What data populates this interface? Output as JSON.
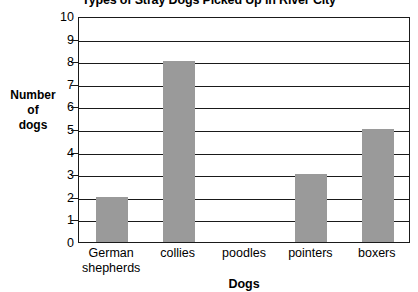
{
  "chart_data": {
    "type": "bar",
    "title": "Types of Stray Dogs Picked Up in River City",
    "xlabel": "Dogs",
    "ylabel": "Number of dogs",
    "ylabel_lines": [
      "Number",
      "of",
      "dogs"
    ],
    "categories": [
      "German shepherds",
      "collies",
      "poodles",
      "pointers",
      "boxers"
    ],
    "category_lines": [
      [
        "German",
        "shepherds"
      ],
      [
        "collies"
      ],
      [
        "poodles"
      ],
      [
        "pointers"
      ],
      [
        "boxers"
      ]
    ],
    "values": [
      2,
      8,
      0,
      3,
      5
    ],
    "ylim": [
      0,
      10
    ],
    "ytick_labels": [
      "0",
      "1",
      "2",
      "3",
      "4",
      "5",
      "6",
      "7",
      "8",
      "9",
      "10"
    ],
    "ytick_values": [
      0,
      1,
      2,
      3,
      4,
      5,
      6,
      7,
      8,
      9,
      10
    ],
    "grid": "horizontal",
    "legend": "none",
    "bar_color": "#9a9a9a",
    "axis_color": "#1a1a1a",
    "background_color": "#ffffff"
  }
}
